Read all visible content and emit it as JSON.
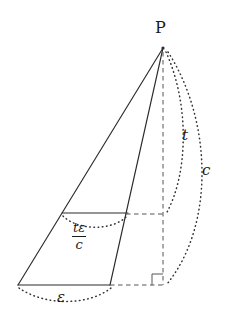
{
  "figure": {
    "type": "geometry-diagram",
    "background_color": "#ffffff",
    "stroke_color": "#2b2b2b"
  },
  "labels": {
    "apex": "P",
    "height_arc": "t",
    "slant_arc": "c",
    "base_arc": "ε",
    "cross_section_numerator": "tε",
    "cross_section_denominator": "c"
  },
  "geometry": {
    "apex_point": {
      "x": 163,
      "y": 48
    },
    "base_left": {
      "x": 18,
      "y": 285
    },
    "base_right": {
      "x": 110,
      "y": 285
    },
    "foot_point": {
      "x": 163,
      "y": 285
    },
    "cross_left": {
      "x": 62,
      "y": 213
    },
    "cross_right": {
      "x": 128,
      "y": 213
    },
    "axis_mid": {
      "x": 163,
      "y": 215
    },
    "right_angle_marker": {
      "x": 152,
      "y": 274,
      "size": 11
    }
  },
  "label_positions": {
    "apex": {
      "x": 155,
      "y": 20
    },
    "height_arc": {
      "x": 182,
      "y": 128
    },
    "slant_arc": {
      "x": 202,
      "y": 163
    },
    "base_arc": {
      "x": 57,
      "y": 290
    },
    "fraction": {
      "x": 72,
      "y": 221
    }
  },
  "strokes": {
    "solid": "solid",
    "dashed": "dashed",
    "dotted": "dotted"
  }
}
